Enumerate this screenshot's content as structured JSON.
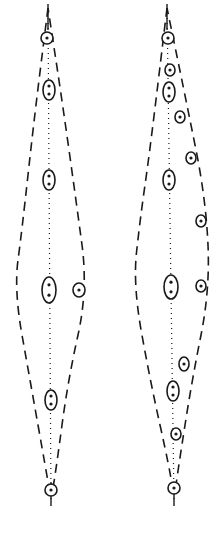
{
  "figure": {
    "stroke_color": "#1a1a1a",
    "background": "#ffffff"
  },
  "spindles": [
    {
      "name": "left-spindle",
      "outline": [
        [
          48,
          8
        ],
        [
          34,
          120
        ],
        [
          22,
          230
        ],
        [
          14,
          290
        ],
        [
          30,
          380
        ],
        [
          46,
          470
        ],
        [
          51,
          500
        ],
        [
          56,
          470
        ],
        [
          68,
          380
        ],
        [
          88,
          290
        ],
        [
          76,
          200
        ],
        [
          62,
          100
        ],
        [
          48,
          8
        ]
      ],
      "axis": [
        [
          48,
          8
        ],
        [
          51,
          500
        ]
      ],
      "bodies": [
        {
          "cx": 47,
          "cy": 38,
          "rx": 6,
          "ry": 6,
          "dots": 1
        },
        {
          "cx": 49,
          "cy": 90,
          "rx": 6,
          "ry": 10,
          "dots": 2
        },
        {
          "cx": 49,
          "cy": 180,
          "rx": 6,
          "ry": 10,
          "dots": 2
        },
        {
          "cx": 49,
          "cy": 290,
          "rx": 7,
          "ry": 13,
          "dots": 2
        },
        {
          "cx": 79,
          "cy": 290,
          "rx": 6,
          "ry": 7,
          "dots": 1
        },
        {
          "cx": 51,
          "cy": 400,
          "rx": 6,
          "ry": 10,
          "dots": 2
        },
        {
          "cx": 51,
          "cy": 490,
          "rx": 6,
          "ry": 6,
          "dots": 1
        }
      ]
    },
    {
      "name": "right-spindle",
      "outline": [
        [
          167,
          8
        ],
        [
          150,
          150
        ],
        [
          140,
          220
        ],
        [
          133,
          285
        ],
        [
          150,
          380
        ],
        [
          170,
          470
        ],
        [
          174,
          500
        ],
        [
          178,
          470
        ],
        [
          192,
          380
        ],
        [
          210,
          290
        ],
        [
          206,
          200
        ],
        [
          186,
          100
        ],
        [
          167,
          8
        ]
      ],
      "axis": [
        [
          167,
          8
        ],
        [
          174,
          500
        ]
      ],
      "bodies": [
        {
          "cx": 168,
          "cy": 38,
          "rx": 6,
          "ry": 6,
          "dots": 1
        },
        {
          "cx": 170,
          "cy": 70,
          "rx": 5,
          "ry": 6,
          "dots": 1
        },
        {
          "cx": 169,
          "cy": 92,
          "rx": 6,
          "ry": 10,
          "dots": 2
        },
        {
          "cx": 180,
          "cy": 117,
          "rx": 5,
          "ry": 6,
          "dots": 1
        },
        {
          "cx": 191,
          "cy": 158,
          "rx": 5,
          "ry": 6,
          "dots": 1
        },
        {
          "cx": 169,
          "cy": 180,
          "rx": 6,
          "ry": 10,
          "dots": 2
        },
        {
          "cx": 201,
          "cy": 221,
          "rx": 5,
          "ry": 6,
          "dots": 1
        },
        {
          "cx": 171,
          "cy": 287,
          "rx": 7,
          "ry": 12,
          "dots": 2
        },
        {
          "cx": 201,
          "cy": 286,
          "rx": 5,
          "ry": 6,
          "dots": 1
        },
        {
          "cx": 184,
          "cy": 364,
          "rx": 5,
          "ry": 7,
          "dots": 1
        },
        {
          "cx": 173,
          "cy": 391,
          "rx": 6,
          "ry": 10,
          "dots": 2
        },
        {
          "cx": 176,
          "cy": 434,
          "rx": 5,
          "ry": 6,
          "dots": 1
        },
        {
          "cx": 174,
          "cy": 488,
          "rx": 6,
          "ry": 6,
          "dots": 1
        }
      ]
    }
  ]
}
